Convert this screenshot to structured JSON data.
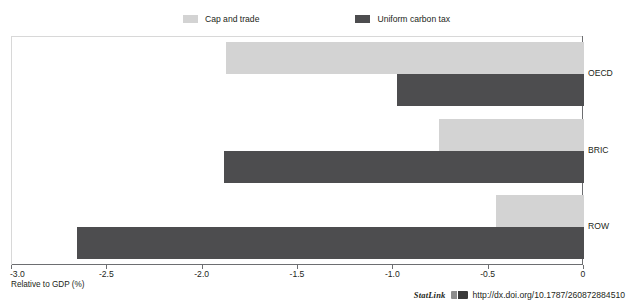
{
  "chart_data": {
    "type": "bar",
    "orientation": "horizontal",
    "title": "",
    "categories": [
      "OECD",
      "BRIC",
      "ROW"
    ],
    "series": [
      {
        "name": "Cap and trade",
        "color": "#d3d3d3",
        "values": [
          -1.88,
          -0.76,
          -0.46
        ]
      },
      {
        "name": "Uniform carbon tax",
        "color": "#4d4d4f",
        "values": [
          -0.98,
          -1.89,
          -2.66
        ]
      }
    ],
    "xlabel": "Relative to GDP (%)",
    "ylabel": "",
    "xlim": [
      -3.0,
      0
    ],
    "xticks": [
      -3.0,
      -2.5,
      -2.0,
      -1.5,
      -1.0,
      -0.5,
      0
    ],
    "xtick_labels": [
      "-3.0",
      "-2.5",
      "-2.0",
      "-1.5",
      "-1.0",
      "-0.5",
      "0"
    ],
    "grid": false,
    "legend_position": "top"
  },
  "legend": {
    "items": [
      {
        "label": "Cap and trade",
        "swatch": "legend-swatch-cap-and-trade"
      },
      {
        "label": "Uniform carbon tax",
        "swatch": "legend-swatch-uniform-carbon-tax"
      }
    ]
  },
  "footer": {
    "statlink_word": "StatLink",
    "statlink_icon": "statlink-icon",
    "url": "http://dx.doi.org/10.1787/260872884510"
  }
}
